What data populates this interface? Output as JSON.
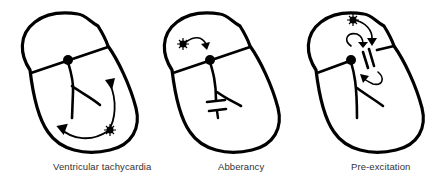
{
  "figure": {
    "panels": [
      {
        "id": "vt",
        "caption": "Ventricular tachycardia"
      },
      {
        "id": "aberrancy",
        "caption": "Abberancy"
      },
      {
        "id": "preexcitation",
        "caption": "Pre-excitation"
      }
    ],
    "colors": {
      "line": "#000000",
      "caption": "#333333",
      "background": "#ffffff"
    }
  }
}
